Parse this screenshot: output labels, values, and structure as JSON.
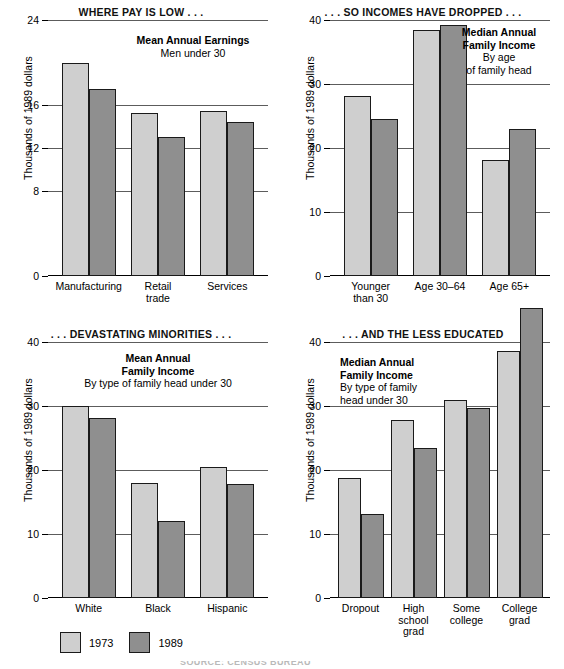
{
  "legend": {
    "items": [
      {
        "label": "1973",
        "color": "#cfcfcf",
        "key": "y1973"
      },
      {
        "label": "1989",
        "color": "#8f8f8f",
        "key": "y1989"
      }
    ]
  },
  "footer": {
    "text": "SOURCE: CENSUS BUREAU"
  },
  "chart_data": [
    {
      "type": "bar",
      "panel_index": 0,
      "title": "WHERE PAY IS LOW . . .",
      "caption_bold": "Mean Annual Earnings",
      "caption_sub": "Men under 30",
      "ylabel": "Thousands of 1989 dollars",
      "xlabel": "",
      "categories": [
        "Manufacturing",
        "Retail\ntrade",
        "Services"
      ],
      "ylim": [
        0,
        24
      ],
      "yticks": [
        0,
        8,
        12,
        16,
        24
      ],
      "ytick_labels": [
        "0",
        "8",
        "12",
        "16",
        "24"
      ],
      "grid": true,
      "series": [
        {
          "name": "1973",
          "values": [
            20.0,
            15.3,
            15.5
          ]
        },
        {
          "name": "1989",
          "values": [
            17.5,
            13.0,
            14.4
          ]
        }
      ]
    },
    {
      "type": "bar",
      "panel_index": 1,
      "title": ". . . SO INCOMES HAVE DROPPED . . .",
      "caption_bold": "Median Annual\nFamily Income",
      "caption_sub": "By age\nof family head",
      "ylabel": "Thousands of 1989 dollars",
      "xlabel": "",
      "categories": [
        "Younger\nthan 30",
        "Age 30–64",
        "Age 65+"
      ],
      "ylim": [
        0,
        40
      ],
      "yticks": [
        0,
        10,
        20,
        30,
        40
      ],
      "ytick_labels": [
        "0",
        "10",
        "20",
        "30",
        "40"
      ],
      "grid": true,
      "series": [
        {
          "name": "1973",
          "values": [
            28.2,
            38.5,
            18.2
          ]
        },
        {
          "name": "1989",
          "values": [
            24.5,
            39.2,
            23.0
          ]
        }
      ]
    },
    {
      "type": "bar",
      "panel_index": 2,
      "title": ". . . DEVASTATING MINORITIES . . .",
      "caption_bold": "Mean Annual\nFamily Income",
      "caption_sub": "By type of family head under 30",
      "ylabel": "Thousands of 1989 dollars",
      "xlabel": "",
      "categories": [
        "White",
        "Black",
        "Hispanic"
      ],
      "ylim": [
        0,
        40
      ],
      "yticks": [
        0,
        10,
        20,
        30,
        40
      ],
      "ytick_labels": [
        "0",
        "10",
        "20",
        "30",
        "40"
      ],
      "grid": true,
      "series": [
        {
          "name": "1973",
          "values": [
            30.0,
            18.0,
            20.5
          ]
        },
        {
          "name": "1989",
          "values": [
            28.2,
            12.0,
            17.8
          ]
        }
      ]
    },
    {
      "type": "bar",
      "panel_index": 3,
      "title": ". . . AND THE LESS EDUCATED",
      "caption_bold": "Median Annual\nFamily Income",
      "caption_sub": "By type of family\nhead under 30",
      "ylabel": "Thousands of 1989 dollars",
      "xlabel": "",
      "categories": [
        "Dropout",
        "High\nschool\ngrad",
        "Some\ncollege",
        "College\ngrad"
      ],
      "ylim": [
        0,
        40
      ],
      "yticks": [
        0,
        10,
        20,
        30,
        40
      ],
      "ytick_labels": [
        "0",
        "10",
        "20",
        "30",
        "40"
      ],
      "grid": true,
      "series": [
        {
          "name": "1973",
          "values": [
            18.8,
            27.8,
            31.0,
            38.6
          ]
        },
        {
          "name": "1989",
          "values": [
            13.1,
            23.5,
            29.7,
            45.3
          ]
        }
      ]
    }
  ]
}
